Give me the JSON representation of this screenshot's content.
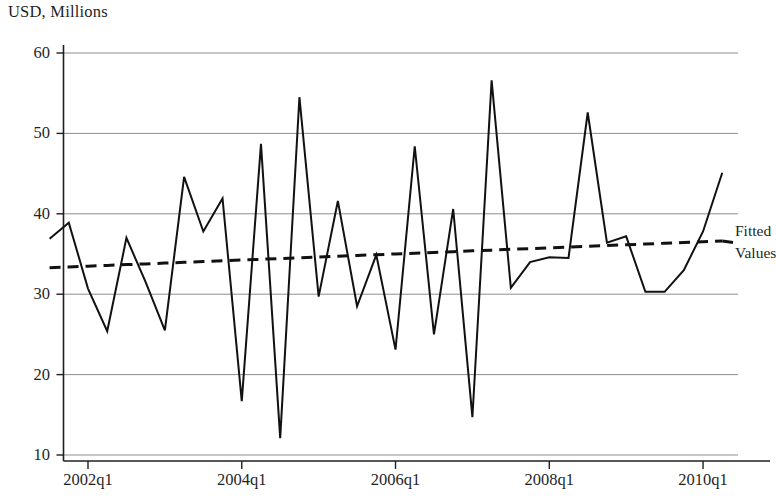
{
  "chart_data": {
    "type": "line",
    "title": "",
    "ylabel": "USD, Millions",
    "xlabel": "",
    "ylim": [
      7.5,
      62
    ],
    "yticks": [
      10,
      20,
      30,
      40,
      50,
      60
    ],
    "ytick_labels": [
      "10",
      "20",
      "30",
      "40",
      "50",
      "60"
    ],
    "xticks": [
      "2002q1",
      "2004q1",
      "2006q1",
      "2008q1",
      "2010q1"
    ],
    "xtick_labels": [
      "2002q1",
      "2004q1",
      "2006q1",
      "2008q1",
      "2010q1"
    ],
    "xlim": [
      "2001q3",
      "2010q3"
    ],
    "grid": "horizontal",
    "legend_position": "right-outside",
    "x": [
      "2001q3",
      "2001q4",
      "2002q1",
      "2002q2",
      "2002q3",
      "2002q4",
      "2003q1",
      "2003q2",
      "2003q3",
      "2003q4",
      "2004q1",
      "2004q2",
      "2004q3",
      "2004q4",
      "2005q1",
      "2005q2",
      "2005q3",
      "2005q4",
      "2006q1",
      "2006q2",
      "2006q3",
      "2006q4",
      "2007q1",
      "2007q2",
      "2007q3",
      "2007q4",
      "2008q1",
      "2008q2",
      "2008q3",
      "2008q4",
      "2009q1",
      "2009q2",
      "2009q3",
      "2009q4",
      "2010q1",
      "2010q2"
    ],
    "series": [
      {
        "name": "Actual",
        "style": "solid",
        "color": "#111111",
        "values": [
          36.9,
          38.9,
          30.7,
          25.4,
          37.0,
          31.5,
          25.5,
          44.6,
          37.8,
          41.9,
          16.7,
          48.7,
          12.1,
          54.5,
          29.7,
          41.6,
          28.5,
          34.9,
          23.1,
          48.4,
          25.0,
          40.6,
          14.7,
          56.6,
          30.8,
          34.0,
          34.6,
          34.5,
          52.6,
          36.4,
          37.2,
          30.3,
          30.3,
          33.0,
          37.8,
          45.1
        ]
      },
      {
        "name": "Fitted Values",
        "style": "dashed",
        "color": "#111111",
        "values": [
          33.3,
          33.39,
          33.49,
          33.58,
          33.68,
          33.77,
          33.87,
          33.96,
          34.06,
          34.15,
          34.25,
          34.34,
          34.44,
          34.53,
          34.63,
          34.72,
          34.82,
          34.91,
          35.01,
          35.1,
          35.2,
          35.29,
          35.39,
          35.48,
          35.58,
          35.67,
          35.77,
          35.86,
          35.96,
          36.05,
          36.15,
          36.24,
          36.34,
          36.43,
          36.53,
          36.62
        ]
      }
    ],
    "legend": [
      {
        "label_line1": "Fitted",
        "label_line2": "Values",
        "style": "dashed"
      }
    ],
    "colors": {
      "line": "#111111",
      "grid": "#8e8e8e",
      "axis": "#1f1f1f",
      "background": "#ffffff"
    }
  },
  "legend": {
    "fitted_label": "Fitted",
    "values_label": "Values"
  },
  "axis": {
    "y_title": "USD, Millions"
  }
}
